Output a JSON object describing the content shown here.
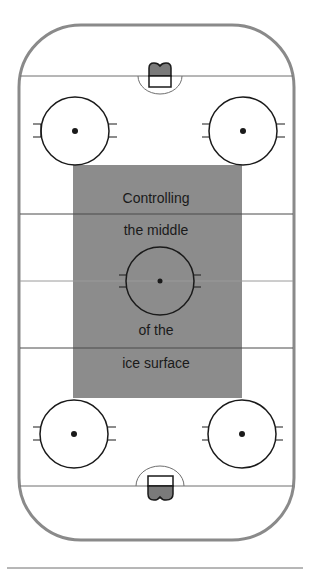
{
  "diagram": {
    "caption_lines": [
      "Controlling",
      "the middle",
      "of the",
      "ice surface"
    ],
    "colors": {
      "boards": "#8a8a8a",
      "lines": "#6e6e6e",
      "circles": "#1a1a1a",
      "highlight_zone": "#8c8c8c",
      "goal_fill": "#7a7a7a",
      "background": "#ffffff"
    },
    "elements": {
      "faceoff_circles": 5,
      "goals": 2,
      "highlight_zone_label": "middle zone"
    }
  }
}
